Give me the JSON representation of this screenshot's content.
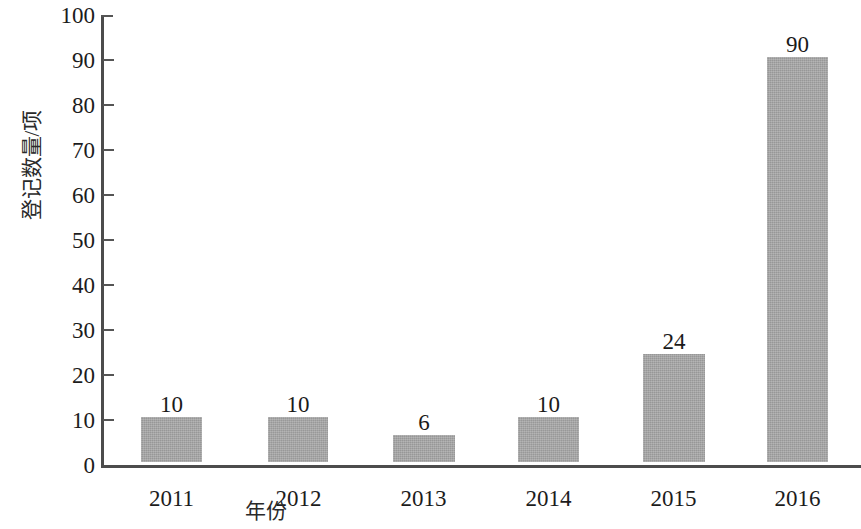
{
  "chart_data": {
    "type": "bar",
    "title": "",
    "subtitle": "",
    "xlabel": "年份",
    "ylabel": "登记数量/项",
    "categories": [
      "2011",
      "2012",
      "2013",
      "2014",
      "2015",
      "2016"
    ],
    "values": [
      10,
      10,
      6,
      10,
      24,
      90
    ],
    "data_labels": [
      "10",
      "10",
      "6",
      "10",
      "24",
      "90"
    ],
    "ylim": [
      0,
      100
    ],
    "yticks": [
      0,
      10,
      20,
      30,
      40,
      50,
      60,
      70,
      80,
      90,
      100
    ],
    "ytick_labels": [
      "0",
      "10",
      "20",
      "30",
      "40",
      "50",
      "60",
      "70",
      "80",
      "90",
      "100"
    ],
    "grid": false,
    "legend": false,
    "legend_position": "none",
    "series": [
      {
        "name": "登记数量",
        "values": [
          10,
          10,
          6,
          10,
          24,
          90
        ]
      }
    ],
    "colors": {
      "bar_fill": "#a4a4a4",
      "axis": "#4c4c4c",
      "text": "#1c1c1c",
      "background": "#ffffff"
    },
    "annotations": []
  }
}
